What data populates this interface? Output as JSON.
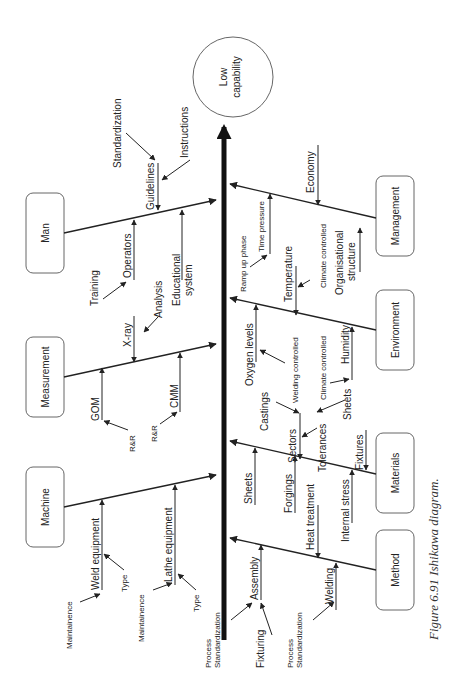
{
  "effect": {
    "line1": "Low",
    "line2": "capability"
  },
  "categories": {
    "man": "Man",
    "measurement": "Measurement",
    "machine": "Machine",
    "management": "Management",
    "environment": "Environment",
    "materials": "Materials",
    "method": "Method"
  },
  "causes": {
    "man": {
      "guidelines": "Guidelines",
      "standardization": "Standardization",
      "instructions": "Instructions",
      "operators": "Operators",
      "training": "Training",
      "educational_1": "Educational",
      "educational_2": "system"
    },
    "measurement": {
      "xray": "X-ray",
      "analysis": "Analysis",
      "gom": "GOM",
      "rr1": "R&R",
      "cmm": "CMM",
      "rr2": "R&R"
    },
    "machine": {
      "weld": "Weld equipment",
      "type1": "Type",
      "maint1": "Maintainence",
      "lathe": "Lathe equipment",
      "maint2": "Maintainence",
      "type2": "Type",
      "proc1": "Process",
      "proc2": "Standardization"
    },
    "management": {
      "economy": "Economy",
      "time_pressure": "Time pressure",
      "ramp_up": "Ramp up phase",
      "org1": "Organisational",
      "org2": "structure",
      "climate": "Climate controlled"
    },
    "environment": {
      "temperature": "Temperature",
      "oxygen": "Oxygen levels",
      "welding_controlled": "Welding controlled",
      "humidity": "Humidity",
      "climate": "Climate controlled"
    },
    "materials": {
      "castings": "Castings",
      "sectors": "Sectors",
      "tolerances": "Tolerances",
      "sheets_top": "Sheets",
      "fixtures": "Fixtures",
      "sheets": "Sheets",
      "forgings": "Forgings",
      "internal_stress": "Internal stress"
    },
    "method": {
      "heat_treatment": "Heat treatment",
      "welding": "Welding",
      "assembly": "Assembly",
      "fixturing": "Fixturing",
      "standardization": "Standardization",
      "proc1": "Process",
      "proc2": "Standardization"
    }
  },
  "caption": "Figure 6.91   Ishikawa diagram."
}
